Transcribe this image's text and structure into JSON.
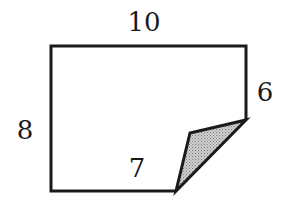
{
  "diagram": {
    "labels": {
      "top": "10",
      "left": "8",
      "right": "6",
      "bottom": "7"
    },
    "colors": {
      "stroke": "#1a1a1a",
      "fold_fill": "#b8b8b8",
      "background": "#ffffff"
    }
  }
}
